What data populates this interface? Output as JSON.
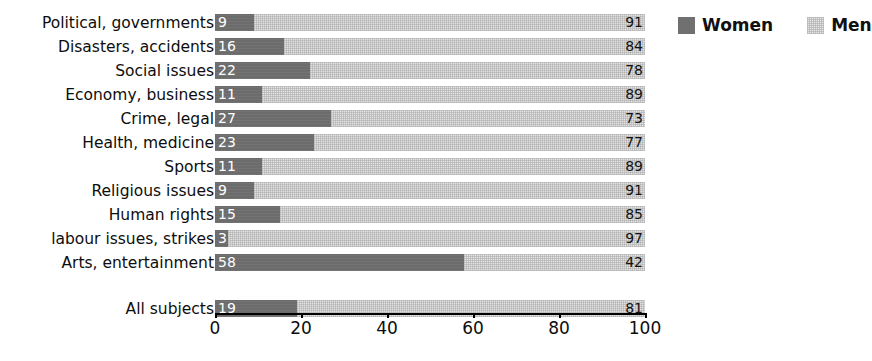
{
  "chart_data": {
    "type": "bar",
    "orientation": "horizontal",
    "stacked": true,
    "title": "",
    "subtitle": "",
    "xlabel": "",
    "ylabel": "",
    "xlim": [
      0,
      100
    ],
    "xticks": [
      0,
      20,
      40,
      60,
      80,
      100
    ],
    "xtick_labels": [
      "0",
      "20",
      "40",
      "60",
      "80",
      "100"
    ],
    "grid": false,
    "legend_position": "top-right",
    "legend": [
      {
        "name": "Women",
        "color": "#6c6c6c",
        "icon": "legend-swatch-women"
      },
      {
        "name": "Men",
        "color": "#e2e2e2",
        "icon": "legend-swatch-men"
      }
    ],
    "categories": [
      "Political, governments",
      "Disasters, accidents",
      "Social issues",
      "Economy, business",
      "Crime, legal",
      "Health, medicine",
      "Sports",
      "Religious issues",
      "Human rights",
      "labour issues, strikes",
      "Arts, entertainment"
    ],
    "series": [
      {
        "name": "Women",
        "values": [
          9,
          16,
          22,
          11,
          27,
          23,
          11,
          9,
          15,
          3,
          58
        ]
      },
      {
        "name": "Men",
        "values": [
          91,
          84,
          78,
          89,
          73,
          77,
          89,
          91,
          85,
          97,
          42
        ]
      }
    ],
    "summary_row": {
      "category": "All subjects",
      "women": 19,
      "men": 81
    }
  },
  "rows": [
    {
      "label": "Political, governments",
      "women": 9,
      "men": 91,
      "women_text": "9",
      "men_text": "91"
    },
    {
      "label": "Disasters, accidents",
      "women": 16,
      "men": 84,
      "women_text": "16",
      "men_text": "84"
    },
    {
      "label": "Social issues",
      "women": 22,
      "men": 78,
      "women_text": "22",
      "men_text": "78"
    },
    {
      "label": "Economy, business",
      "women": 11,
      "men": 89,
      "women_text": "11",
      "men_text": "89"
    },
    {
      "label": "Crime, legal",
      "women": 27,
      "men": 73,
      "women_text": "27",
      "men_text": "73"
    },
    {
      "label": "Health, medicine",
      "women": 23,
      "men": 77,
      "women_text": "23",
      "men_text": "77"
    },
    {
      "label": "Sports",
      "women": 11,
      "men": 89,
      "women_text": "11",
      "men_text": "89"
    },
    {
      "label": "Religious issues",
      "women": 9,
      "men": 91,
      "women_text": "9",
      "men_text": "91"
    },
    {
      "label": "Human rights",
      "women": 15,
      "men": 85,
      "women_text": "15",
      "men_text": "85"
    },
    {
      "label": "labour issues, strikes",
      "women": 3,
      "men": 97,
      "women_text": "3",
      "men_text": "97"
    },
    {
      "label": "Arts, entertainment",
      "women": 58,
      "men": 42,
      "women_text": "58",
      "men_text": "42"
    }
  ],
  "total_row": {
    "label": "All subjects",
    "women": 19,
    "men": 81,
    "women_text": "19",
    "men_text": "81"
  },
  "axis": {
    "ticks": [
      {
        "value": 0,
        "label": "0"
      },
      {
        "value": 20,
        "label": "20"
      },
      {
        "value": 40,
        "label": "40"
      },
      {
        "value": 60,
        "label": "60"
      },
      {
        "value": 80,
        "label": "80"
      },
      {
        "value": 100,
        "label": "100"
      }
    ]
  },
  "colors": {
    "women": "#6c6c6c",
    "men": "#e2e2e2",
    "text": "#0d0d0d",
    "background": "#ffffff"
  }
}
